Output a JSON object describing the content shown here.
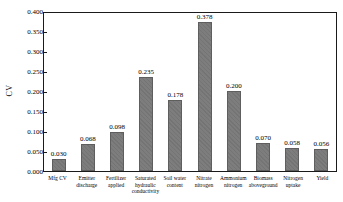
{
  "chart_data": {
    "type": "bar",
    "title": "",
    "xlabel": "",
    "ylabel": "CV",
    "ylim": [
      0,
      0.4
    ],
    "ytick_step": 0.05,
    "yticks": [
      "0.000",
      "0.050",
      "0.100",
      "0.150",
      "0.200",
      "0.250",
      "0.300",
      "0.350",
      "0.400"
    ],
    "grid": false,
    "legend": "none",
    "bar_color": "#7d7d7d",
    "bar_border_color": "#5e5e5e",
    "categories": [
      "Mfg CV",
      "Emitter discharge",
      "Fertilizer applied",
      "Saturated hydraulic conductivity",
      "Soil water content",
      "Nitrate nitrogen",
      "Ammonium nitrogen",
      "Biomass aboveground",
      "Nitrogen uptake",
      "Yield"
    ],
    "values": [
      0.03,
      0.068,
      0.098,
      0.235,
      0.178,
      0.378,
      0.2,
      0.07,
      0.058,
      0.056
    ],
    "value_labels": [
      "0.030",
      "0.068",
      "0.098",
      "0.235",
      "0.178",
      "0.378",
      "0.200",
      "0.070",
      "0.058",
      "0.056"
    ]
  }
}
